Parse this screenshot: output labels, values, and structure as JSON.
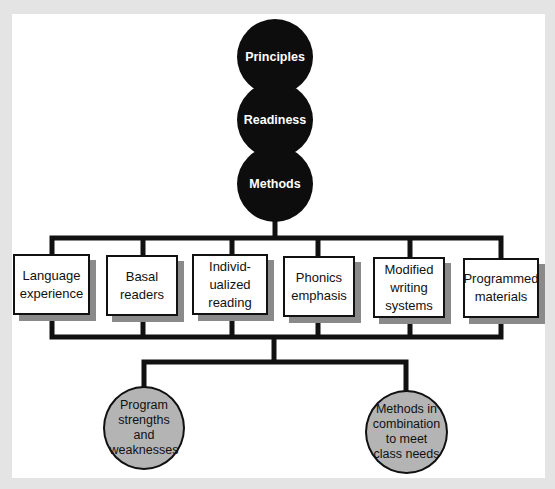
{
  "diagram": {
    "top_nodes": [
      {
        "label": "Principles"
      },
      {
        "label": "Readiness"
      },
      {
        "label": "Methods"
      }
    ],
    "method_boxes": [
      {
        "label": "Language\nexperience"
      },
      {
        "label": "Basal\nreaders"
      },
      {
        "label": "Individ-\nualized\nreading"
      },
      {
        "label": "Phonics\nemphasis"
      },
      {
        "label": "Modified\nwriting\nsystems"
      },
      {
        "label": "Programmed\nmaterials"
      }
    ],
    "outcome_nodes": [
      {
        "label": "Program\nstrengths\nand\nweaknesses"
      },
      {
        "label": "Methods in\ncombination\nto meet\nclass needs"
      }
    ],
    "colors": {
      "background": "#e4e4e4",
      "panel": "#ffffff",
      "dark_node": "#0d0d0d",
      "outcome_node": "#b4b4b4",
      "line": "#111111",
      "box_shadow": "#8a8a8a"
    }
  }
}
